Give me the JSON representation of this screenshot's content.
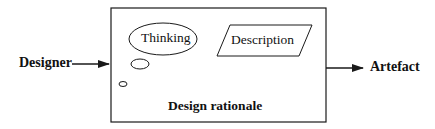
{
  "diagram": {
    "input_label": "Designer",
    "output_label": "Artefact",
    "container_label": "Design rationale",
    "thinking_label": "Thinking",
    "description_label": "Description",
    "colors": {
      "stroke": "#1a1a1a",
      "text": "#111111",
      "background": "#ffffff"
    },
    "icons": {
      "input_arrow": "arrow-right-icon",
      "output_arrow": "arrow-right-icon",
      "thought_bubble": "thought-bubble-icon"
    }
  }
}
